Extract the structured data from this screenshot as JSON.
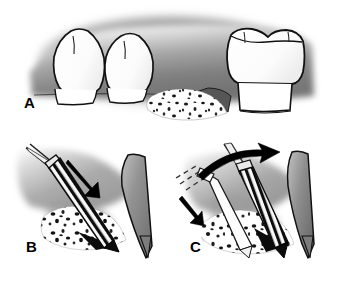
{
  "figure": {
    "panels": [
      {
        "id": "A",
        "label": "A",
        "caption": "Edentulous ridge defect between teeth with particulate bone graft material",
        "elements": [
          {
            "name": "premolar-tooth-left",
            "type": "tooth",
            "shape": "single-cusp-crown"
          },
          {
            "name": "premolar-tooth-right",
            "type": "tooth",
            "shape": "single-cusp-crown"
          },
          {
            "name": "molar-tooth",
            "type": "tooth",
            "shape": "multi-cusp-crown"
          },
          {
            "name": "gingiva-background",
            "type": "soft-tissue"
          },
          {
            "name": "bone-graft-particles",
            "type": "particulate-graft"
          },
          {
            "name": "ridge-defect",
            "type": "osseous-defect"
          }
        ]
      },
      {
        "id": "B",
        "label": "B",
        "caption": "Osteotome / chisel inserted into the graft site, apical force direction",
        "elements": [
          {
            "name": "striped-instrument",
            "type": "osteotome",
            "pattern": "diagonal-stripes"
          },
          {
            "name": "force-arrow",
            "type": "arrow",
            "direction": "down-right",
            "style": "solid-black"
          },
          {
            "name": "bone-graft-particles",
            "type": "particulate-graft"
          },
          {
            "name": "root-surface",
            "type": "tooth-root"
          },
          {
            "name": "cortical-plate",
            "type": "bone-wall"
          }
        ]
      },
      {
        "id": "C",
        "label": "C",
        "caption": "Instrument repositioned and levered coronally; dashed outline shows prior position",
        "elements": [
          {
            "name": "striped-instrument",
            "type": "osteotome",
            "pattern": "diagonal-stripes"
          },
          {
            "name": "ghost-instrument",
            "type": "osteotome-outline",
            "style": "dashed-previous-position"
          },
          {
            "name": "lever-arrow",
            "type": "arrow",
            "direction": "up-right",
            "style": "curved-black"
          },
          {
            "name": "insertion-arrow",
            "type": "arrow",
            "direction": "down-right",
            "style": "solid-black-small"
          },
          {
            "name": "bone-graft-particles",
            "type": "particulate-graft"
          },
          {
            "name": "cortical-plate",
            "type": "bone-wall"
          }
        ]
      }
    ]
  },
  "colors": {
    "background": "#ffffff",
    "outline": "#000000",
    "tissue_mid": "#8a8a8a",
    "tissue_dark": "#5a5a5a",
    "tissue_light": "#c8c8c8",
    "tooth_fill": "#fdfdfd",
    "graft_fill": "#ffffff",
    "graft_speckle": "#1a1a1a",
    "instrument_stripe_dark": "#111111",
    "instrument_stripe_light": "#f5f5f5"
  }
}
